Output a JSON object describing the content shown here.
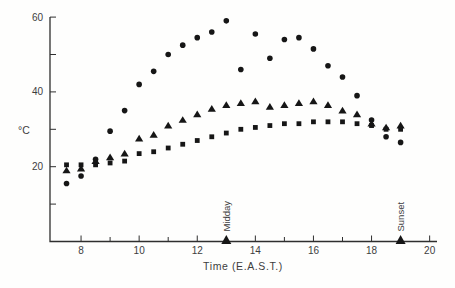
{
  "figure": {
    "kind": "scanned-scatter-plot"
  },
  "chart_data": {
    "type": "scatter",
    "title": "",
    "xlabel": "Time (E.A.S.T.)",
    "ylabel": "°C",
    "xlim": [
      7,
      20
    ],
    "ylim": [
      0,
      62
    ],
    "grid": false,
    "legend": "none",
    "x_major_ticks": [
      8,
      10,
      12,
      14,
      16,
      18,
      20
    ],
    "x_minor_ticks": [
      9,
      11,
      13,
      15,
      17,
      19
    ],
    "y_ticks": [
      10,
      20,
      30,
      40,
      50,
      60
    ],
    "y_tick_labels": [
      20,
      40,
      60
    ],
    "x": [
      7.5,
      8,
      8.5,
      9,
      9.5,
      10,
      10.5,
      11,
      11.5,
      12,
      12.5,
      13,
      13.5,
      14,
      14.5,
      15,
      15.5,
      16,
      16.5,
      17,
      17.5,
      18,
      18.5,
      19
    ],
    "series": [
      {
        "name": "circles",
        "marker": "circle",
        "values": [
          15.5,
          17.5,
          22,
          29.5,
          35,
          42,
          45.5,
          50,
          52.5,
          54.5,
          56,
          59,
          46,
          55.5,
          49,
          54,
          54.5,
          51.5,
          47,
          44,
          39,
          32.5,
          28,
          26.5
        ]
      },
      {
        "name": "triangles",
        "marker": "triangle",
        "values": [
          19,
          19.5,
          21.5,
          22.5,
          23.5,
          27.5,
          28.5,
          31,
          32.5,
          34,
          35.5,
          36.5,
          37,
          37.5,
          36,
          36.5,
          37,
          37.5,
          36.5,
          35,
          34,
          31.5,
          30.5,
          31
        ]
      },
      {
        "name": "squares",
        "marker": "square",
        "values": [
          20.5,
          20.5,
          20.5,
          21,
          21.5,
          23.5,
          24,
          25,
          26,
          27,
          28,
          29,
          30,
          30.5,
          31,
          31.5,
          31.5,
          32,
          32,
          32,
          31.5,
          31,
          30,
          30
        ]
      }
    ],
    "annotations": [
      {
        "label": "Midday",
        "x": 13
      },
      {
        "label": "Sunset",
        "x": 19
      }
    ],
    "colors": {
      "marker": "#161616",
      "axis": "#2f2f2f",
      "text": "#3d3d3d"
    }
  }
}
